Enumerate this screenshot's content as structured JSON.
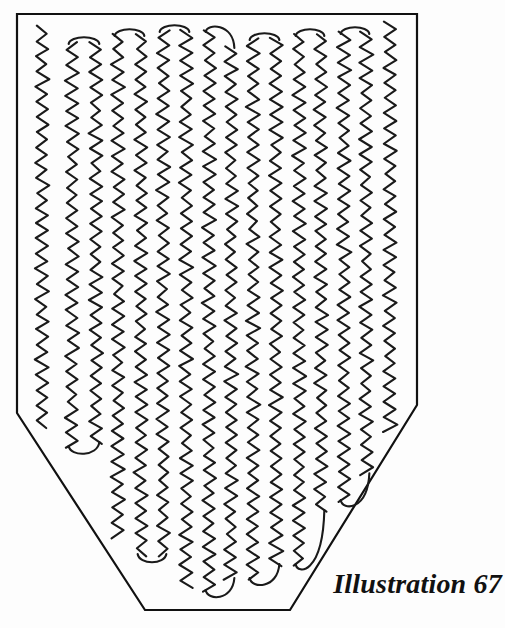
{
  "figure": {
    "caption": "Illustration 67",
    "title": "Illustration 67",
    "colors": {
      "background": "#fdfdfd",
      "ink": "#1a1a1a",
      "border": "#111111"
    },
    "canvas": {
      "width": 505,
      "height": 628
    },
    "outline": {
      "name": "pentagon-frame",
      "stroke_width": 2.2,
      "points": "17,14 417,14 417,405 290,610 145,610 17,413"
    },
    "scribble": {
      "name": "serpentine-zigzag-scribble",
      "description": "Continuous hand-drawn boustrophedon zigzag columns filling the pentagon",
      "stroke_width": 2.1,
      "zigzag_period": 7.6,
      "zigzag_amplitude": 5.6,
      "jitter": 0.9,
      "columns": [
        {
          "x": 42,
          "top": 26,
          "bottom": 428,
          "turn_top": false,
          "turn_bottom": false
        },
        {
          "x": 72,
          "top": 42,
          "bottom": 448,
          "turn_top": true,
          "turn_bottom": true
        },
        {
          "x": 96,
          "top": 42,
          "bottom": 444,
          "turn_top": false,
          "turn_bottom": false
        },
        {
          "x": 118,
          "top": 34,
          "bottom": 538,
          "turn_top": true,
          "turn_bottom": false
        },
        {
          "x": 141,
          "top": 34,
          "bottom": 556,
          "turn_top": false,
          "turn_bottom": true
        },
        {
          "x": 163,
          "top": 30,
          "bottom": 556,
          "turn_top": true,
          "turn_bottom": false
        },
        {
          "x": 186,
          "top": 30,
          "bottom": 588,
          "turn_top": false,
          "turn_bottom": false
        },
        {
          "x": 209,
          "top": 30,
          "bottom": 592,
          "turn_top": true,
          "turn_bottom": true
        },
        {
          "x": 231,
          "top": 46,
          "bottom": 580,
          "turn_top": false,
          "turn_bottom": false
        },
        {
          "x": 253,
          "top": 38,
          "bottom": 580,
          "turn_top": true,
          "turn_bottom": true
        },
        {
          "x": 276,
          "top": 38,
          "bottom": 566,
          "turn_top": false,
          "turn_bottom": false
        },
        {
          "x": 299,
          "top": 34,
          "bottom": 566,
          "turn_top": true,
          "turn_bottom": true
        },
        {
          "x": 321,
          "top": 34,
          "bottom": 512,
          "turn_top": false,
          "turn_bottom": false
        },
        {
          "x": 344,
          "top": 32,
          "bottom": 502,
          "turn_top": true,
          "turn_bottom": true
        },
        {
          "x": 366,
          "top": 32,
          "bottom": 498,
          "turn_top": false,
          "turn_bottom": false
        },
        {
          "x": 390,
          "top": 22,
          "bottom": 470,
          "turn_top": true,
          "turn_bottom": false
        }
      ]
    }
  }
}
